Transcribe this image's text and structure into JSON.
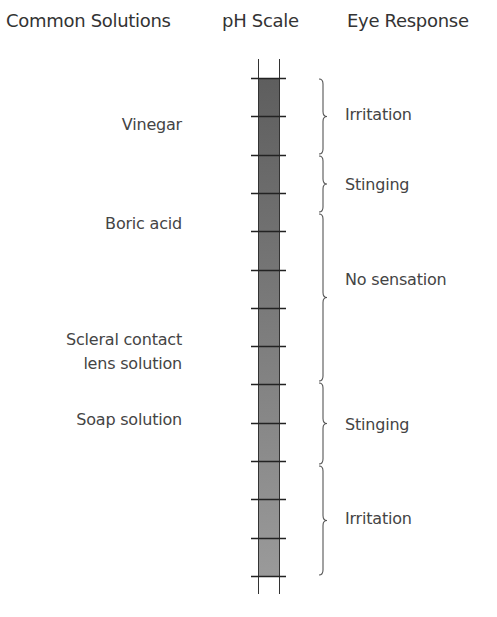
{
  "headers": {
    "solutions": "Common Solutions",
    "ph_scale": "pH Scale",
    "eye_response": "Eye Response"
  },
  "solutions": [
    {
      "label": "Vinegar",
      "y": 113
    },
    {
      "label": "Boric acid",
      "y": 212
    },
    {
      "label": "Scleral contact\nlens solution",
      "line1": "Scleral contact",
      "line2": "lens solution",
      "y": 328
    },
    {
      "label": "Soap solution",
      "y": 408
    }
  ],
  "responses": [
    {
      "label": "Irritation",
      "range": [
        78,
        155
      ]
    },
    {
      "label": "Stinging",
      "range": [
        155,
        213
      ]
    },
    {
      "label": "No sensation",
      "range": [
        213,
        382
      ]
    },
    {
      "label": "Stinging",
      "range": [
        382,
        465
      ]
    },
    {
      "label": "Irritation",
      "range": [
        465,
        576
      ]
    }
  ],
  "scale": {
    "tick_count": 14,
    "top": 78,
    "bottom": 576,
    "color_top": "#5e5e5e",
    "color_bottom": "#9a9a9a"
  }
}
